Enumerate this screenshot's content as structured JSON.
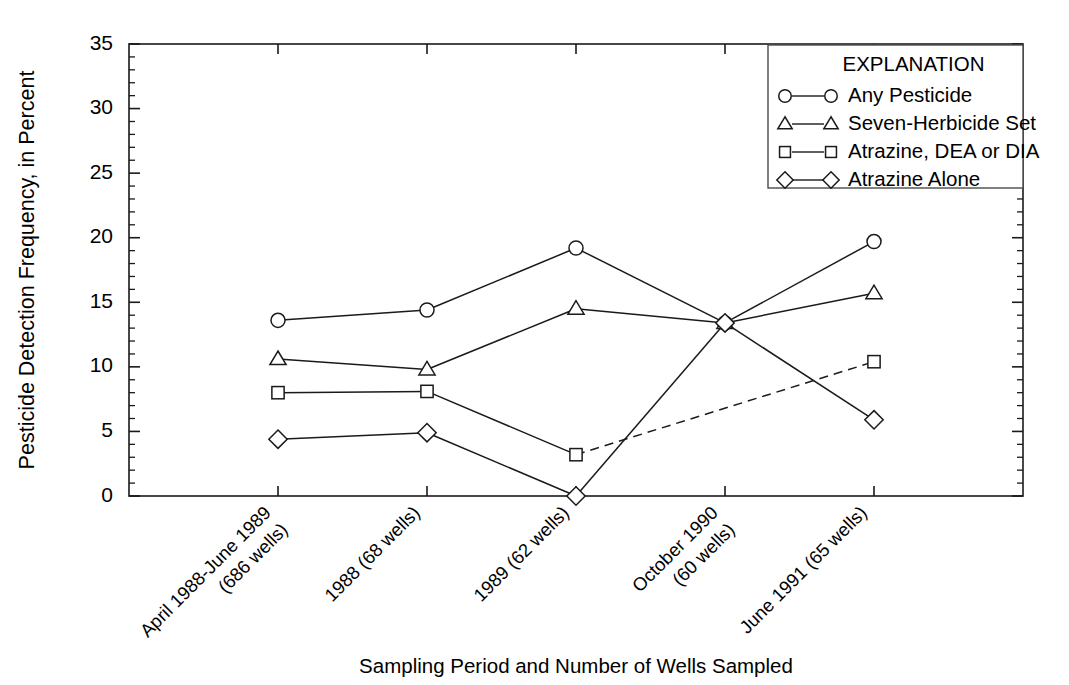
{
  "chart_data": {
    "type": "line",
    "title": "",
    "xlabel": "Sampling Period and Number of Wells Sampled",
    "ylabel": "Pesticide Detection Frequency, in Percent",
    "ylim": [
      0,
      35
    ],
    "ytick_step": 5,
    "yminor_step": 1,
    "grid": false,
    "legend_position": "top-right",
    "legend_title": "EXPLANATION",
    "categories": [
      "April 1988-June 1989\n(686 wells)",
      "1988 (68 wells)",
      "1989 (62 wells)",
      "October 1990\n(60 wells)",
      "June 1991 (65 wells)"
    ],
    "ytick_labels": [
      "0",
      "5",
      "10",
      "15",
      "20",
      "25",
      "30",
      "35"
    ],
    "ytick_values": [
      0,
      5,
      10,
      15,
      20,
      25,
      30,
      35
    ],
    "series": [
      {
        "name": "Any Pesticide",
        "marker": "circle",
        "linestyle": "solid",
        "values": [
          13.6,
          14.4,
          19.2,
          13.4,
          19.7
        ]
      },
      {
        "name": "Seven-Herbicide Set",
        "marker": "triangle",
        "linestyle": "solid",
        "values": [
          10.6,
          9.8,
          14.5,
          13.4,
          15.7
        ]
      },
      {
        "name": "Atrazine, DEA or DIA",
        "marker": "square",
        "linestyle": "solid-then-dashed",
        "dash_from_index": 2,
        "values": [
          8.0,
          8.1,
          3.2,
          null,
          10.4
        ]
      },
      {
        "name": "Atrazine Alone",
        "marker": "diamond",
        "linestyle": "solid",
        "values": [
          4.4,
          4.9,
          0.0,
          13.4,
          5.9
        ]
      }
    ]
  },
  "legend": {
    "title": "EXPLANATION",
    "entries": [
      {
        "label": "Any Pesticide",
        "marker": "circle"
      },
      {
        "label": "Seven-Herbicide Set",
        "marker": "triangle"
      },
      {
        "label": "Atrazine, DEA or DIA",
        "marker": "square"
      },
      {
        "label": "Atrazine Alone",
        "marker": "diamond"
      }
    ]
  },
  "axes": {
    "y_title": "Pesticide Detection Frequency, in Percent",
    "x_title": "Sampling Period and Number of Wells Sampled"
  },
  "colors": {
    "ink": "#1a1a1a",
    "background": "#ffffff",
    "frame": "#4a4a4a"
  }
}
